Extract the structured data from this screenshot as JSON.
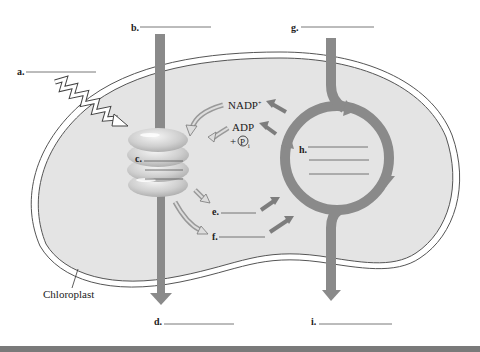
{
  "diagram": {
    "structure_label": "Chloroplast",
    "blank_labels": [
      {
        "id": "a",
        "text": "a."
      },
      {
        "id": "b",
        "text": "b."
      },
      {
        "id": "c",
        "text": "c."
      },
      {
        "id": "d",
        "text": "d."
      },
      {
        "id": "e",
        "text": "e."
      },
      {
        "id": "f",
        "text": "f."
      },
      {
        "id": "g",
        "text": "g."
      },
      {
        "id": "h",
        "text": "h."
      },
      {
        "id": "i",
        "text": "i."
      }
    ],
    "molecules": {
      "nadp": "NADP",
      "nadp_sup": "+",
      "adp": "ADP",
      "plus": "+",
      "pi_symbol": "P",
      "pi_sub": "i"
    }
  },
  "colors": {
    "stroma": "#e4e4e4",
    "outline": "#555555",
    "arrow": "#8a8a8a",
    "arrow_dark": "#6f6f6f",
    "bottom_bar": "#7a7a7a"
  }
}
